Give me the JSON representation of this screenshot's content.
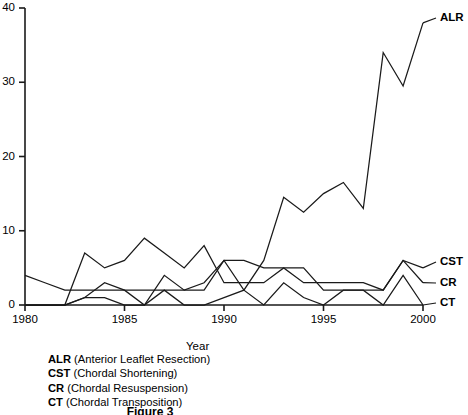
{
  "figure": {
    "caption": "Figure 3",
    "axis_title_x": "Year"
  },
  "legend": {
    "items": [
      {
        "abbr": "ALR",
        "full": "(Anterior Leaflet Resection)"
      },
      {
        "abbr": "CST",
        "full": "(Chordal Shortening)"
      },
      {
        "abbr": "CR",
        "full": "(Chordal Resuspension)"
      },
      {
        "abbr": "CT",
        "full": "(Chordal Transposition)"
      }
    ]
  },
  "series_end_labels": [
    {
      "name": "ALR",
      "x": 440,
      "y": 18
    },
    {
      "name": "CST",
      "x": 440,
      "y": 262
    },
    {
      "name": "CR",
      "x": 440,
      "y": 283
    },
    {
      "name": "CT",
      "x": 440,
      "y": 303
    }
  ],
  "chart_data": {
    "type": "line",
    "title": "Figure 3",
    "xlabel": "Year",
    "ylabel": "",
    "xlim": [
      1980,
      2000
    ],
    "ylim": [
      0,
      40
    ],
    "xticks": [
      1980,
      1985,
      1990,
      1995,
      2000
    ],
    "yticks": [
      0,
      10,
      20,
      30,
      40
    ],
    "grid": false,
    "legend_position": "right-end-labels",
    "x": [
      1980,
      1981,
      1982,
      1983,
      1984,
      1985,
      1986,
      1987,
      1988,
      1989,
      1990,
      1991,
      1992,
      1993,
      1994,
      1995,
      1996,
      1997,
      1998,
      1999,
      2000
    ],
    "series": [
      {
        "name": "ALR",
        "label": "ALR (Anterior Leaflet Resection)",
        "values": [
          0,
          0,
          0,
          1,
          1,
          0,
          0,
          2,
          0,
          0,
          1,
          2,
          6,
          14.5,
          12.5,
          15,
          16.5,
          13,
          34,
          29.5,
          38
        ]
      },
      {
        "name": "CST",
        "label": "CST (Chordal Shortening)",
        "values": [
          4,
          3,
          2,
          2,
          2,
          2,
          2,
          2,
          2,
          2,
          6,
          6,
          5,
          5,
          3,
          3,
          3,
          3,
          2,
          6,
          5
        ]
      },
      {
        "name": "CR",
        "label": "CR (Chordal Resuspension)",
        "values": [
          0,
          0,
          0,
          7,
          5,
          6,
          9,
          7,
          5,
          8,
          3,
          3,
          3,
          5,
          5,
          2,
          2,
          2,
          2,
          6,
          3
        ]
      },
      {
        "name": "CT",
        "label": "CT (Chordal Transposition)",
        "values": [
          0,
          0,
          0,
          1,
          3,
          2,
          0,
          4,
          2,
          3,
          6,
          2,
          0,
          3,
          1,
          0,
          2,
          2,
          0,
          4,
          0
        ]
      }
    ]
  }
}
